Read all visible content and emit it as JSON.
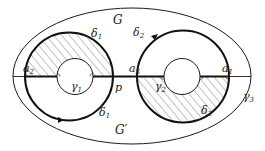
{
  "diagram": {
    "colors": {
      "stroke": "#1a1a1a",
      "hatch": "#555555",
      "background": "#ffffff"
    },
    "labels": {
      "G": "G",
      "G_prime": "G′",
      "delta1_top": "δ",
      "delta1_top_sub": "1",
      "delta1_bottom": "δ",
      "delta1_bottom_sub": "1",
      "delta2_top": "δ",
      "delta2_top_sub": "2",
      "delta2_bottom": "δ",
      "delta2_bottom_sub": "2",
      "a1": "a",
      "a1_sub": "1",
      "a2": "a",
      "a2_sub": "2",
      "a3": "a",
      "a3_sub": "3",
      "gamma1": "γ",
      "gamma1_sub": "1",
      "gamma2": "γ",
      "gamma2_sub": "2",
      "gamma3": "γ",
      "gamma3_sub": "3",
      "p": "p"
    }
  }
}
